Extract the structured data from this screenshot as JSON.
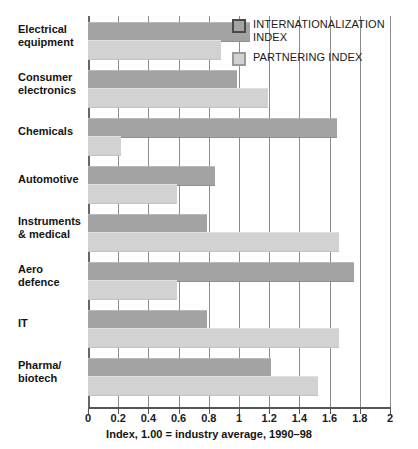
{
  "chart_data": {
    "type": "bar",
    "orientation": "horizontal",
    "title": "",
    "subtitle": "",
    "xlabel": "Index, 1.00 = industry average, 1990–98",
    "ylabel": "",
    "xlim": [
      0,
      2
    ],
    "xtick_step": 0.2,
    "xticks": [
      "0",
      "0.2",
      "0.4",
      "0.6",
      "0.8",
      "1",
      "1.2",
      "1.4",
      "1.6",
      "1.8",
      "2"
    ],
    "xtick_values": [
      0,
      0.2,
      0.4,
      0.6,
      0.8,
      1,
      1.2,
      1.4,
      1.6,
      1.8,
      2
    ],
    "grid": true,
    "grid_axis": "x",
    "legend_position": "top-right",
    "categories": [
      "Electrical equipment",
      "Consumer electronics",
      "Chemicals",
      "Automotive",
      "Instruments & medical",
      "Aero defence",
      "IT",
      "Pharma/ biotech"
    ],
    "category_lines": [
      [
        "Electrical",
        "equipment"
      ],
      [
        "Consumer",
        "electronics"
      ],
      [
        "Chemicals",
        ""
      ],
      [
        "Automotive",
        ""
      ],
      [
        "Instruments",
        "& medical"
      ],
      [
        "Aero",
        "defence"
      ],
      [
        "IT",
        ""
      ],
      [
        "Pharma/",
        "biotech"
      ]
    ],
    "series": [
      {
        "name": "INTERNATIONALIZATION INDEX",
        "color": "#a3a3a3",
        "values": [
          1.07,
          0.99,
          1.65,
          0.84,
          0.79,
          1.76,
          0.79,
          1.21
        ]
      },
      {
        "name": "PARTNERING INDEX",
        "color": "#d2d2d2",
        "values": [
          0.88,
          1.19,
          0.22,
          0.59,
          1.66,
          0.59,
          1.66,
          1.52
        ]
      }
    ]
  },
  "legend": {
    "items": [
      {
        "label_line1": "INTERNATIONALIZATION",
        "label_line2": "INDEX",
        "swatch": "internationalization"
      },
      {
        "label_line1": "PARTNERING INDEX",
        "label_line2": "",
        "swatch": "partnering"
      }
    ]
  },
  "caption": {
    "text": "Index, 1.00 = industry average, 1990–98"
  }
}
